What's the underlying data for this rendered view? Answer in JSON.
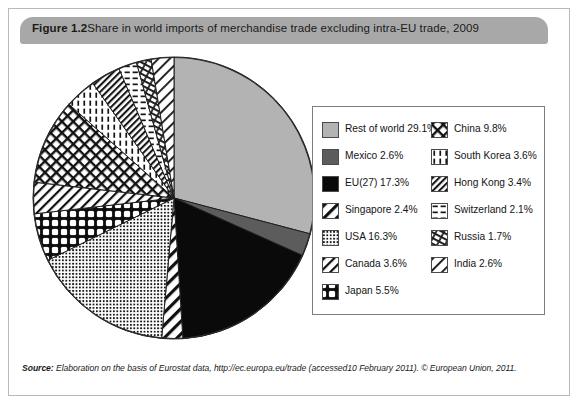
{
  "figure": {
    "number_label": "Figure 1.2",
    "caption": "Share in world imports of merchandise trade excluding intra-EU trade, 2009"
  },
  "source": {
    "lead": "Source:",
    "text": " Elaboration on the basis of Eurostat data, http://ec.europa.eu/trade (accessed10 February 2011). © European Union, 2011."
  },
  "legend": {
    "left_column": [
      {
        "label": "Rest of world 29.1%",
        "pattern": "solid-light-gray"
      },
      {
        "label": "Mexico 2.6%",
        "pattern": "solid-dark-gray"
      },
      {
        "label": "EU(27) 17.3%",
        "pattern": "solid-black"
      },
      {
        "label": "Singapore 2.4%",
        "pattern": "diagonal-stripe-wide"
      },
      {
        "label": "USA 16.3%",
        "pattern": "fine-dot-grid"
      },
      {
        "label": "Canada 3.6%",
        "pattern": "diagonal-hatch-right"
      },
      {
        "label": "Japan 5.5%",
        "pattern": "plus-grid"
      }
    ],
    "right_column": [
      {
        "label": "China 9.8%",
        "pattern": "diagonal-cross"
      },
      {
        "label": "South Korea 3.6%",
        "pattern": "vertical-dash"
      },
      {
        "label": "Hong Kong 3.4%",
        "pattern": "dense-diagonal"
      },
      {
        "label": "Switzerland 2.1%",
        "pattern": "horizontal-dash"
      },
      {
        "label": "Russia 1.7%",
        "pattern": "wavy-diagonal"
      },
      {
        "label": "India 2.6%",
        "pattern": "diagonal-hatch-light"
      }
    ]
  },
  "chart_data": {
    "type": "pie",
    "title": "Share in world imports of merchandise trade excluding intra-EU trade, 2009",
    "subtitle": "",
    "xlabel": "",
    "ylabel": "",
    "unit": "%",
    "start_angle_deg": 0,
    "direction": "clockwise",
    "legend_position": "right",
    "grid": false,
    "categories": [
      "Rest of world",
      "Mexico",
      "EU(27)",
      "Singapore",
      "USA",
      "Japan",
      "Canada",
      "China",
      "South Korea",
      "Hong Kong",
      "Switzerland",
      "Russia",
      "India"
    ],
    "values": [
      29.1,
      2.6,
      17.3,
      2.4,
      16.3,
      5.5,
      3.6,
      9.8,
      3.6,
      3.4,
      2.1,
      1.7,
      2.6
    ],
    "slices": [
      {
        "name": "Rest of world",
        "value": 29.1,
        "label": "Rest of world 29.1%",
        "pattern": "solid-light-gray"
      },
      {
        "name": "Mexico",
        "value": 2.6,
        "label": "Mexico 2.6%",
        "pattern": "solid-dark-gray"
      },
      {
        "name": "EU(27)",
        "value": 17.3,
        "label": "EU(27) 17.3%",
        "pattern": "solid-black"
      },
      {
        "name": "Singapore",
        "value": 2.4,
        "label": "Singapore 2.4%",
        "pattern": "diagonal-stripe-wide"
      },
      {
        "name": "USA",
        "value": 16.3,
        "label": "USA 16.3%",
        "pattern": "fine-dot-grid"
      },
      {
        "name": "Japan",
        "value": 5.5,
        "label": "Japan 5.5%",
        "pattern": "plus-grid"
      },
      {
        "name": "Canada",
        "value": 3.6,
        "label": "Canada 3.6%",
        "pattern": "diagonal-hatch-right"
      },
      {
        "name": "China",
        "value": 9.8,
        "label": "China 9.8%",
        "pattern": "diagonal-cross"
      },
      {
        "name": "South Korea",
        "value": 3.6,
        "label": "South Korea 3.6%",
        "pattern": "vertical-dash"
      },
      {
        "name": "Hong Kong",
        "value": 3.4,
        "label": "Hong Kong 3.4%",
        "pattern": "dense-diagonal"
      },
      {
        "name": "Switzerland",
        "value": 2.1,
        "label": "Switzerland 2.1%",
        "pattern": "horizontal-dash"
      },
      {
        "name": "Russia",
        "value": 1.7,
        "label": "Russia 1.7%",
        "pattern": "wavy-diagonal"
      },
      {
        "name": "India",
        "value": 2.6,
        "label": "India 2.6%",
        "pattern": "diagonal-hatch-light"
      }
    ]
  },
  "colors": {
    "banner": "#a8a8a8",
    "frame_border": "#b9b9b9",
    "legend_border": "#7d7d7d",
    "light_gray": "#b3b3b3",
    "dark_gray": "#5c5c5c",
    "black": "#0a0a0a",
    "text": "#141414"
  },
  "geometry": {
    "pie_center_x": 146,
    "pie_center_y": 146,
    "pie_radius": 141
  }
}
